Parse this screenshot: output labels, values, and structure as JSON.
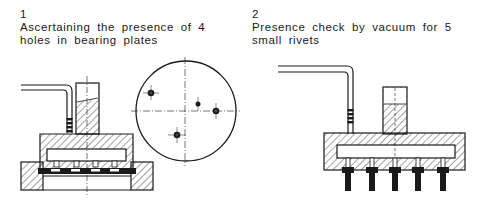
{
  "figures": [
    {
      "number": "1",
      "caption": "Ascertaining the presence of 4 holes in bearing plates",
      "parts": [
        "pneumatic-line",
        "sensing-head",
        "bearing-plate",
        "fixture-base",
        "top-view-circle"
      ],
      "top_view": {
        "holes": 4
      }
    },
    {
      "number": "2",
      "caption": "Presence check by vacuum for 5 small rivets",
      "parts": [
        "pneumatic-line",
        "vacuum-head",
        "rivets"
      ],
      "rivets": 5
    }
  ],
  "colors": {
    "ink": "#1a1a1a",
    "background": "#ffffff"
  }
}
